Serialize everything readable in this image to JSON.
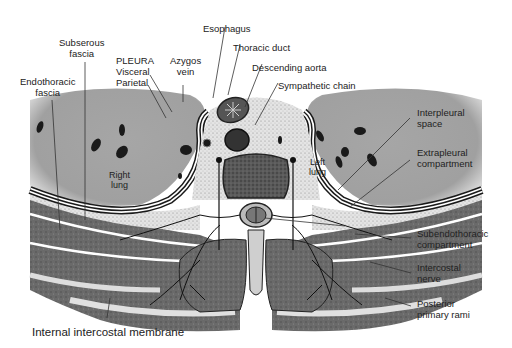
{
  "figure": {
    "type": "anatomical cross-section",
    "colors": {
      "lung": "#a8a8a8",
      "lung_edge": "#d8d8d8",
      "pleura_white": "#ffffff",
      "pleura_black": "#1a1a1a",
      "stipple": "#e2e2e2",
      "muscle": "#6c6c6c",
      "muscle_dark": "#4a4a4a",
      "vertebra": "#555555",
      "background": "#ffffff"
    },
    "labels": {
      "esophagus": "Esophagus",
      "thoracic_duct": "Thoracic duct",
      "descending_aorta": "Descending aorta",
      "sympathetic_chain": "Sympathetic chain",
      "subserous_fascia": [
        "Subserous",
        "fascia"
      ],
      "endothoracic_fascia": [
        "Endothoracic",
        "fascia"
      ],
      "pleura": [
        "PLEURA",
        "Visceral",
        "Parietal"
      ],
      "azygos_vein": [
        "Azygos",
        "vein"
      ],
      "interpleural_space": [
        "Interpleural",
        "space"
      ],
      "extrapleural_compartment": [
        "Extrapleural",
        "compartment"
      ],
      "subendothoracic_compartment": [
        "Subendothoracic",
        "compartment"
      ],
      "intercostal_nerve": [
        "Intercostal",
        "nerve"
      ],
      "posterior_primary_rami": [
        "Posterior",
        "primary rami"
      ],
      "internal_intercostal_membrane": "Internal intercostal membrane",
      "right_lung": [
        "Right",
        "lung"
      ],
      "left_lung": [
        "Left",
        "lung"
      ]
    }
  }
}
